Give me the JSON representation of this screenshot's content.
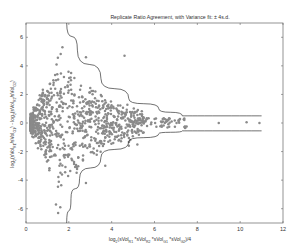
{
  "chart_data": {
    "type": "scatter",
    "title": "Replicate Ratio Agreement, with Variance fit:   ± 4s.d.",
    "xlabel": "log2(sVol_R1*sVol_R2*sVol_G1*sVol_G2)/4",
    "ylabel": "log2(sVol_R1/sVol_G1) - log2(sVol_R2/sVol_G2)",
    "xlim": [
      0,
      12
    ],
    "ylim": [
      -7,
      7
    ],
    "xticks": [
      0,
      2,
      4,
      6,
      8,
      10,
      12
    ],
    "yticks": [
      -6,
      -4,
      -2,
      0,
      2,
      4,
      6
    ],
    "grid": false,
    "legend": null,
    "point_color": "#8a8a8a",
    "curve_color": "#333333",
    "envelope": {
      "label": "± 4 s.d. variance fit",
      "upper": [
        [
          1.9,
          7.0
        ],
        [
          2.4,
          5.1
        ],
        [
          3.5,
          3.1
        ],
        [
          4.8,
          1.7
        ],
        [
          6.2,
          1.0
        ],
        [
          7.3,
          0.5
        ],
        [
          11.0,
          0.5
        ]
      ],
      "lower": [
        [
          1.9,
          -7.0
        ],
        [
          2.1,
          -5.3
        ],
        [
          2.5,
          -3.9
        ],
        [
          3.5,
          -2.4
        ],
        [
          4.8,
          -1.3
        ],
        [
          6.2,
          -0.75
        ],
        [
          7.3,
          -0.55
        ],
        [
          11.0,
          -0.55
        ]
      ]
    },
    "summary": {
      "n_points_approx": 1000,
      "dense_region_x": [
        0.2,
        5.5
      ],
      "max_abs_y": 5.5,
      "sparse_points": [
        [
          1.7,
          5.3
        ],
        [
          2.8,
          4.6
        ],
        [
          4.6,
          4.7
        ],
        [
          6.8,
          0.1
        ],
        [
          9.0,
          0.0
        ],
        [
          10.3,
          0.05
        ],
        [
          10.9,
          0.0
        ],
        [
          4.8,
          -1.6
        ],
        [
          5.2,
          -1.5
        ],
        [
          3.7,
          -3.0
        ],
        [
          2.8,
          -4.2
        ],
        [
          1.6,
          -5.9
        ],
        [
          1.4,
          -5.7
        ],
        [
          1.5,
          -6.3
        ]
      ]
    }
  },
  "labels": {
    "title": "Replicate Ratio Agreement, with Variance fit:",
    "title_suffix": "± 4s.d.",
    "x_ticks": [
      "0",
      "2",
      "4",
      "6",
      "8",
      "10",
      "12"
    ],
    "y_ticks": [
      "6",
      "4",
      "2",
      "0",
      "-2",
      "-4",
      "-6"
    ]
  }
}
